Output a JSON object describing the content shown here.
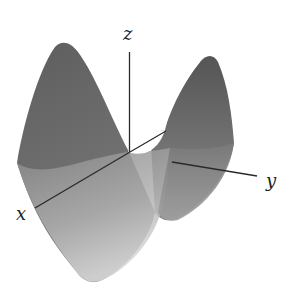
{
  "figure": {
    "axes": {
      "x_label": "x",
      "y_label": "y",
      "z_label": "z"
    },
    "colors": {
      "surface_dark": "#5a5a5a",
      "surface_mid": "#7d7d7d",
      "surface_light": "#c8c8c8",
      "axis": "#2a2a2a",
      "background": "#ffffff"
    }
  }
}
